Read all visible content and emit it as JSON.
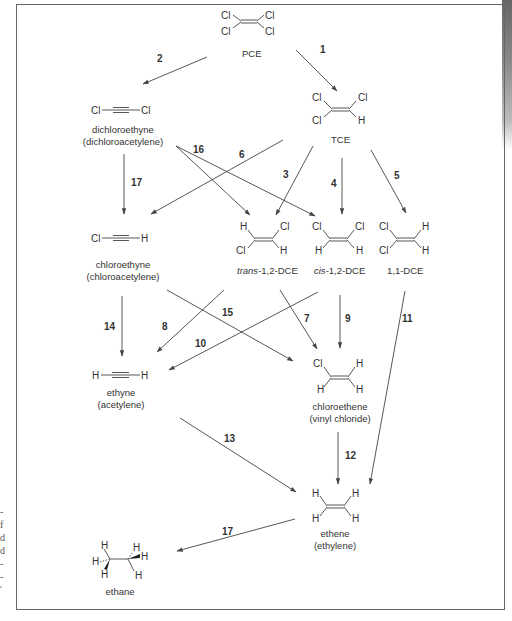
{
  "diagram": {
    "type": "reaction-pathway",
    "compounds": {
      "pce": {
        "label": "PCE"
      },
      "tce": {
        "label": "TCE"
      },
      "dichloroethyne": {
        "label": "dichloroethyne",
        "alt": "(dichloroacetylene)"
      },
      "chloroethyne": {
        "label": "chloroethyne",
        "alt": "(chloroacetylene)"
      },
      "trans_dce": {
        "prefix": "trans",
        "label": "-1,2-DCE"
      },
      "cis_dce": {
        "prefix": "cis",
        "label": "-1,2-DCE"
      },
      "dce11": {
        "label": "1,1-DCE"
      },
      "ethyne": {
        "label": "ethyne",
        "alt": "(acetylene)"
      },
      "chloroethene": {
        "label": "chloroethene",
        "alt": "(vinyl chloride)"
      },
      "ethene": {
        "label": "ethene",
        "alt": "(ethylene)"
      },
      "ethane": {
        "label": "ethane"
      }
    },
    "atoms": {
      "cl": "Cl",
      "h": "H"
    },
    "reactions": [
      {
        "id": "1",
        "from": "PCE",
        "to": "TCE"
      },
      {
        "id": "2",
        "from": "PCE",
        "to": "dichloroethyne"
      },
      {
        "id": "3",
        "from": "TCE",
        "to": "trans-1,2-DCE"
      },
      {
        "id": "4",
        "from": "TCE",
        "to": "cis-1,2-DCE"
      },
      {
        "id": "5",
        "from": "TCE",
        "to": "1,1-DCE"
      },
      {
        "id": "6",
        "from": "TCE",
        "to": "chloroethyne"
      },
      {
        "id": "7",
        "from": "trans-1,2-DCE",
        "to": "chloroethene"
      },
      {
        "id": "8",
        "from": "trans-1,2-DCE",
        "to": "ethyne"
      },
      {
        "id": "9",
        "from": "cis-1,2-DCE",
        "to": "chloroethene"
      },
      {
        "id": "10",
        "from": "cis-1,2-DCE",
        "to": "ethyne"
      },
      {
        "id": "11",
        "from": "1,1-DCE",
        "to": "ethene"
      },
      {
        "id": "12",
        "from": "chloroethene",
        "to": "ethene"
      },
      {
        "id": "13",
        "from": "ethyne",
        "to": "ethene"
      },
      {
        "id": "14",
        "from": "chloroethyne",
        "to": "ethyne"
      },
      {
        "id": "15",
        "from": "chloroethyne",
        "to": "chloroethene"
      },
      {
        "id": "16",
        "from": "dichloroethyne",
        "to": "trans-1,2-DCE / cis-1,2-DCE"
      },
      {
        "id": "17",
        "from": "dichloroethyne",
        "to": "chloroethyne"
      },
      {
        "id": "17",
        "from": "ethene",
        "to": "ethane"
      }
    ]
  },
  "margin_marks": [
    "-",
    "f",
    "d",
    "d",
    "-",
    "-",
    "'"
  ]
}
